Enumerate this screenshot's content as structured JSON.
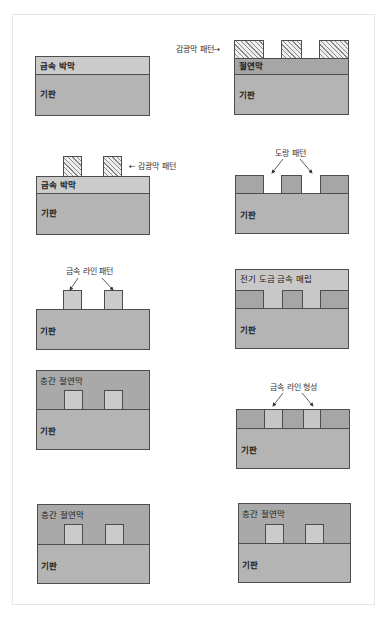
{
  "figure": {
    "colors": {
      "substrate": "#b4b4b4",
      "metal_thin_film": "#cbcbcb",
      "insulating_film": "#a6a6a6",
      "interlayer_dielectric": "#a9a9a9",
      "photoresist_hatch": "#8a8a8a",
      "outline": "#4d4d4d",
      "frame_border": "#e6e6e6"
    },
    "left_column": [
      {
        "step": 1,
        "layers": {
          "top": "금속 박막",
          "substrate": "기판"
        }
      },
      {
        "step": 2,
        "layers": {
          "top": "금속 박막",
          "substrate": "기판"
        },
        "callout": "감광막 패턴"
      },
      {
        "step": 3,
        "layers": {
          "substrate": "기판"
        },
        "callout": "금속 라인 패턴"
      },
      {
        "step": 4,
        "layers": {
          "top": "층간 절연막",
          "substrate": "기판"
        }
      },
      {
        "step": 5,
        "layers": {
          "top": "층간 절연막",
          "substrate": "기판"
        }
      }
    ],
    "right_column": [
      {
        "step": 1,
        "layers": {
          "top": "절연막",
          "substrate": "기판"
        },
        "callout": "감광막 패턴"
      },
      {
        "step": 2,
        "layers": {
          "substrate": "기판"
        },
        "callout": "도랑 패턴"
      },
      {
        "step": 3,
        "layers": {
          "top": "전기 도금 금속 매립",
          "substrate": "기판"
        }
      },
      {
        "step": 4,
        "layers": {
          "substrate": "기판"
        },
        "callout": "금속 라인 형성"
      },
      {
        "step": 5,
        "layers": {
          "top": "층간 절연막",
          "substrate": "기판"
        }
      }
    ]
  },
  "labels": {
    "l1_metal": "금속 박막",
    "l1_sub": "기판",
    "l2_metal": "금속 박막",
    "l2_sub": "기판",
    "l2_callout": "← 감광막 패턴",
    "l3_sub": "기판",
    "l3_callout": "금속 라인 패턴",
    "l4_ild": "층간 절연막",
    "l4_sub": "기판",
    "l5_ild": "층간 절연막",
    "l5_sub": "기판",
    "r1_callout": "감광막 패턴→",
    "r1_insul": "절연막",
    "r1_sub": "기판",
    "r2_callout": "도랑 패턴",
    "r2_sub": "기판",
    "r3_fill": "전기 도금 금속 매립",
    "r3_sub": "기판",
    "r4_callout": "금속 라인 형성",
    "r4_sub": "기판",
    "r5_ild": "층간 절연막",
    "r5_sub": "기판"
  }
}
